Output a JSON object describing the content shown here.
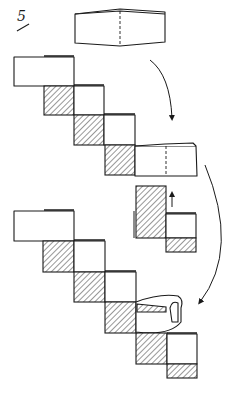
{
  "diagram": {
    "type": "paper-folding-instructions",
    "step_label": "5",
    "colors": {
      "ink": "#1a1a1a",
      "paper": "#ffffff"
    },
    "panels": [
      {
        "name": "unit-module",
        "description": "single folded rectangular module with dashed center crease"
      },
      {
        "name": "staircase-assembly-top",
        "description": "staircase of alternating white and hatched blocks, last module attached at right"
      },
      {
        "name": "insertion-detail",
        "description": "hatched tab inserted into white pocket, small up arrow"
      },
      {
        "name": "staircase-assembly-bottom",
        "description": "longer staircase with next module being curled and inserted"
      }
    ],
    "arrows": [
      {
        "name": "arrow-module-to-staircase",
        "direction": "down"
      },
      {
        "name": "arrow-up-insert",
        "direction": "up"
      },
      {
        "name": "arrow-curve-to-bottom",
        "direction": "down-left"
      }
    ]
  }
}
